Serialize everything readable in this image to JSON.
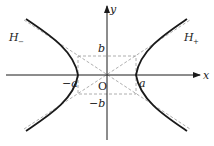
{
  "diagram": {
    "type": "hyperbola",
    "equation": "x^2/a^2 - y^2/b^2 = 1",
    "labels": {
      "x_axis": "x",
      "y_axis": "y",
      "origin": "O",
      "a_pos": "a",
      "a_neg": "−a",
      "b_pos": "b",
      "b_neg": "−b",
      "branch_right": "H",
      "branch_right_sub": "+",
      "branch_left": "H",
      "branch_left_sub": "−"
    },
    "elements": [
      "x-axis with arrow",
      "y-axis with arrow",
      "dashed rectangle with corners (±a, ±b)",
      "dashed asymptotes y = ±(b/a)x",
      "right branch H+",
      "left branch H−"
    ],
    "colors": {
      "curve": "#1a1a1a",
      "axes": "#1a1a1a",
      "dashed": "#9a9a9a"
    }
  }
}
